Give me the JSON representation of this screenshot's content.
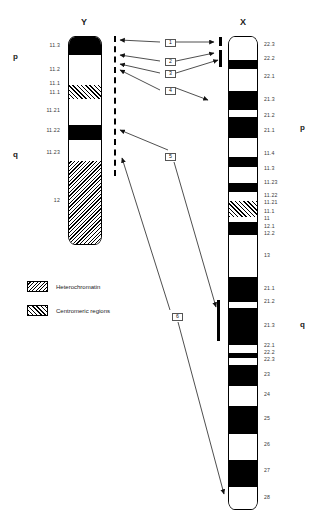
{
  "figure": {
    "title_y": "Y",
    "title_x": "X"
  },
  "chromosome_y": {
    "name": "Y",
    "arm_labels": [
      {
        "label": "p",
        "y": 57
      },
      {
        "label": "q",
        "y": 155
      }
    ],
    "bands": [
      {
        "label": "11.3",
        "stain": "dark",
        "top": 36,
        "height": 18,
        "label_y": 45
      },
      {
        "label": "11.2",
        "stain": "light",
        "top": 54,
        "height": 30,
        "label_y": 69
      },
      {
        "label": "11.1",
        "stain": "cen",
        "top": 84,
        "height": 14,
        "label_y": 83
      },
      {
        "label": "11.1",
        "stain": "cen",
        "top": 84,
        "height": 14,
        "label_y": 92
      },
      {
        "label": "11.21",
        "stain": "light",
        "top": 98,
        "height": 26,
        "label_y": 110
      },
      {
        "label": "11.22",
        "stain": "dark",
        "top": 124,
        "height": 15,
        "label_y": 130
      },
      {
        "label": "11.23",
        "stain": "light",
        "top": 139,
        "height": 21,
        "label_y": 152
      },
      {
        "label": "12",
        "stain": "het",
        "top": 160,
        "height": 85,
        "label_y": 200
      }
    ]
  },
  "chromosome_x": {
    "name": "X",
    "arm_labels": [
      {
        "label": "p",
        "y": 128
      },
      {
        "label": "q",
        "y": 325
      }
    ],
    "bands": [
      {
        "label": "22.3",
        "stain": "light",
        "top": 36,
        "height": 23,
        "label_y": 44
      },
      {
        "label": "22.2",
        "stain": "dark",
        "top": 59,
        "height": 9,
        "label_y": 58
      },
      {
        "label": "22.1",
        "stain": "light",
        "top": 68,
        "height": 22,
        "label_y": 76
      },
      {
        "label": "21.3",
        "stain": "dark",
        "top": 90,
        "height": 19,
        "label_y": 99
      },
      {
        "label": "21.2",
        "stain": "light",
        "top": 109,
        "height": 7,
        "label_y": 115
      },
      {
        "label": "21.1",
        "stain": "dark",
        "top": 116,
        "height": 21,
        "label_y": 130
      },
      {
        "label": "11.4",
        "stain": "light",
        "top": 137,
        "height": 19,
        "label_y": 153
      },
      {
        "label": "11.3",
        "stain": "dark",
        "top": 156,
        "height": 10,
        "label_y": 168
      },
      {
        "label": "11.23",
        "stain": "light",
        "top": 166,
        "height": 16,
        "label_y": 182
      },
      {
        "label": "11.22",
        "stain": "dark",
        "top": 182,
        "height": 9,
        "label_y": 195
      },
      {
        "label": "11.21",
        "stain": "light",
        "top": 191,
        "height": 9,
        "label_y": 202
      },
      {
        "label": "11.1",
        "stain": "cen",
        "top": 200,
        "height": 16,
        "label_y": 211
      },
      {
        "label": "11",
        "stain": "cen",
        "top": 200,
        "height": 16,
        "label_y": 218
      },
      {
        "label": "12.1",
        "stain": "light",
        "top": 216,
        "height": 5,
        "label_y": 226
      },
      {
        "label": "12.2",
        "stain": "dark",
        "top": 221,
        "height": 13,
        "label_y": 233
      },
      {
        "label": "13",
        "stain": "light",
        "top": 234,
        "height": 42,
        "label_y": 255
      },
      {
        "label": "21.1",
        "stain": "dark",
        "top": 276,
        "height": 25,
        "label_y": 288
      },
      {
        "label": "21.2",
        "stain": "light",
        "top": 301,
        "height": 6,
        "label_y": 301
      },
      {
        "label": "21.3",
        "stain": "dark",
        "top": 307,
        "height": 37,
        "label_y": 325
      },
      {
        "label": "22.1",
        "stain": "light",
        "top": 344,
        "height": 8,
        "label_y": 345
      },
      {
        "label": "22.2",
        "stain": "dark",
        "top": 352,
        "height": 5,
        "label_y": 352
      },
      {
        "label": "22.3",
        "stain": "light",
        "top": 357,
        "height": 7,
        "label_y": 359
      },
      {
        "label": "23",
        "stain": "dark",
        "top": 364,
        "height": 21,
        "label_y": 374
      },
      {
        "label": "24",
        "stain": "light",
        "top": 385,
        "height": 20,
        "label_y": 394
      },
      {
        "label": "25",
        "stain": "dark",
        "top": 405,
        "height": 28,
        "label_y": 418
      },
      {
        "label": "26",
        "stain": "light",
        "top": 433,
        "height": 26,
        "label_y": 444
      },
      {
        "label": "27",
        "stain": "dark",
        "top": 459,
        "height": 27,
        "label_y": 470
      },
      {
        "label": "28",
        "stain": "light",
        "top": 486,
        "height": 24,
        "label_y": 497
      }
    ]
  },
  "callout_boxes": [
    {
      "id": "1",
      "label": "1",
      "x": 165,
      "y": 39
    },
    {
      "id": "2",
      "label": "2",
      "x": 165,
      "y": 58
    },
    {
      "id": "3",
      "label": "3",
      "x": 165,
      "y": 70
    },
    {
      "id": "4",
      "label": "4",
      "x": 165,
      "y": 87
    },
    {
      "id": "5",
      "label": "5",
      "x": 165,
      "y": 153
    },
    {
      "id": "6",
      "label": "6",
      "x": 172,
      "y": 313
    }
  ],
  "legend": [
    {
      "swatch": "het",
      "label": "Heterochromatin"
    },
    {
      "swatch": "cen",
      "label": "Centromeric regions"
    }
  ],
  "colors": {
    "band_dark": "#000000",
    "band_light": "#ffffff",
    "outline": "#000000",
    "label_text": "#3a3a3a",
    "box_border": "#555555"
  }
}
